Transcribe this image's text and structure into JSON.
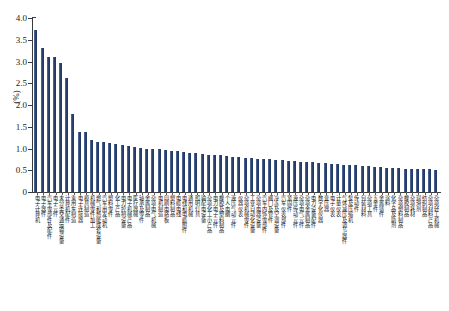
{
  "chart_data": {
    "type": "bar",
    "title": "",
    "xlabel": "",
    "ylabel": "(%)",
    "ylim": [
      0,
      4.0
    ],
    "ytick_values": [
      0,
      0.5,
      1.0,
      1.5,
      2.0,
      2.5,
      3.0,
      3.5,
      4.0
    ],
    "ytick_labels": [
      "0",
      "0.5",
      "1.0",
      "1.5",
      "2.0",
      "2.5",
      "3.0",
      "3.5",
      "4.0"
    ],
    "grid": false,
    "legend": null,
    "bar_color": "#2b4472",
    "categories": [
      "电子计算机",
      "电子器件",
      "汽车零部件及配件",
      "电子元件",
      "未分类交通运输设备",
      "计算机配件",
      "乘用车制造",
      "电子连接器",
      "模具制造",
      "机械零件加工",
      "燃气和热能成套设备",
      "汽车用发动机",
      "塑料零件",
      "化工产品",
      "电力控制设备",
      "电子机械产品",
      "医疗器械",
      "轴承及零件",
      "金属制品",
      "杂项电气机械",
      "电机制造",
      "印刷电路板",
      "塑料制品",
      "电缆电线",
      "电线和电缆附件",
      "通用机械",
      "照明灯具",
      "输配电设备",
      "杂项化工小产品",
      "电力电子元件",
      "橡胶及塑料制品",
      "个人电脑",
      "液压气动元件",
      "仪器仪表",
      "杂项机械零件",
      "工业自动化设备",
      "杂项电器设备",
      "汽车内饰零部件",
      "阀门及管件",
      "冷冻及空调设备",
      "汽车仪表部件",
      "紧固件",
      "液压传动元件",
      "杂项电气元件",
      "杂项金属制品",
      "电力设备配件",
      "数字化仪器",
      "变压器",
      "电子仪表",
      "计量仪表",
      "气体减压及调节器件",
      "泵及压缩机",
      "传动件",
      "包装材料",
      "杂项工具",
      "五金件",
      "金属铸件",
      "涂料",
      "化学品及助剂",
      "杂项塑料制品",
      "橡胶制品",
      "杂项耗材",
      "润滑剂",
      "纺织制品",
      "杂项材料产品",
      "杂项轻工机械"
    ],
    "values": [
      3.72,
      3.3,
      3.1,
      3.1,
      2.97,
      2.61,
      1.79,
      1.39,
      1.38,
      1.2,
      1.16,
      1.14,
      1.12,
      1.1,
      1.08,
      1.06,
      1.04,
      1.02,
      1.0,
      0.99,
      0.98,
      0.96,
      0.95,
      0.94,
      0.92,
      0.9,
      0.89,
      0.88,
      0.86,
      0.85,
      0.84,
      0.83,
      0.81,
      0.8,
      0.79,
      0.78,
      0.77,
      0.76,
      0.75,
      0.74,
      0.73,
      0.72,
      0.71,
      0.7,
      0.69,
      0.68,
      0.67,
      0.66,
      0.65,
      0.64,
      0.63,
      0.62,
      0.61,
      0.6,
      0.59,
      0.58,
      0.57,
      0.56,
      0.56,
      0.55,
      0.54,
      0.53,
      0.53,
      0.52,
      0.52,
      0.51
    ]
  }
}
